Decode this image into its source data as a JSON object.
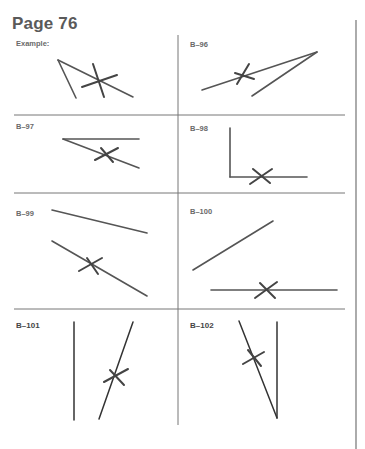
{
  "page": {
    "title": "Page 76",
    "colors": {
      "ink": "#555555",
      "grid": "#777777",
      "title": "#5a5a5a"
    }
  },
  "problems": [
    {
      "id": "example",
      "label": "Example:",
      "segments": [
        [
          58,
          60,
          76,
          98
        ],
        [
          58,
          60,
          133,
          97
        ]
      ],
      "marks": [
        [
          93,
          64,
          104,
          97
        ],
        [
          82,
          87,
          117,
          75
        ]
      ]
    },
    {
      "id": "b-96",
      "label": "B–96",
      "segments": [
        [
          317,
          52,
          202,
          90
        ],
        [
          317,
          52,
          252,
          96
        ]
      ],
      "marks": [
        [
          237,
          84,
          249,
          64
        ],
        [
          235,
          73,
          254,
          79
        ]
      ]
    },
    {
      "id": "b-97",
      "label": "B–97",
      "segments": [
        [
          63,
          139,
          139,
          139
        ],
        [
          63,
          139,
          139,
          168
        ]
      ],
      "marks": [
        [
          95,
          160,
          118,
          148
        ],
        [
          101,
          148,
          113,
          162
        ]
      ]
    },
    {
      "id": "b-98",
      "label": "B–98",
      "segments": [
        [
          230,
          128,
          230,
          177
        ],
        [
          230,
          177,
          307,
          177
        ]
      ],
      "marks": [
        [
          250,
          184,
          272,
          169
        ],
        [
          253,
          169,
          270,
          183
        ]
      ]
    },
    {
      "id": "b-99",
      "label": "B–99",
      "segments": [
        [
          52,
          210,
          147,
          233
        ],
        [
          52,
          241,
          147,
          296
        ]
      ],
      "marks": [
        [
          79,
          271,
          102,
          258
        ],
        [
          87,
          258,
          98,
          274
        ]
      ]
    },
    {
      "id": "b-100",
      "label": "B–100",
      "segments": [
        [
          193,
          270,
          273,
          221
        ],
        [
          211,
          290,
          337,
          290
        ]
      ],
      "marks": [
        [
          255,
          298,
          277,
          282
        ],
        [
          260,
          283,
          275,
          298
        ]
      ]
    },
    {
      "id": "b-101",
      "label": "B–101",
      "segments": [
        [
          74,
          322,
          74,
          420
        ],
        [
          133,
          322,
          99,
          419
        ]
      ],
      "marks": [
        [
          104,
          382,
          128,
          369
        ],
        [
          110,
          370,
          124,
          385
        ]
      ]
    },
    {
      "id": "b-102",
      "label": "B–102",
      "segments": [
        [
          277,
          322,
          277,
          418
        ],
        [
          239,
          321,
          277,
          418
        ]
      ],
      "marks": [
        [
          243,
          364,
          264,
          352
        ],
        [
          248,
          350,
          261,
          366
        ]
      ]
    }
  ]
}
